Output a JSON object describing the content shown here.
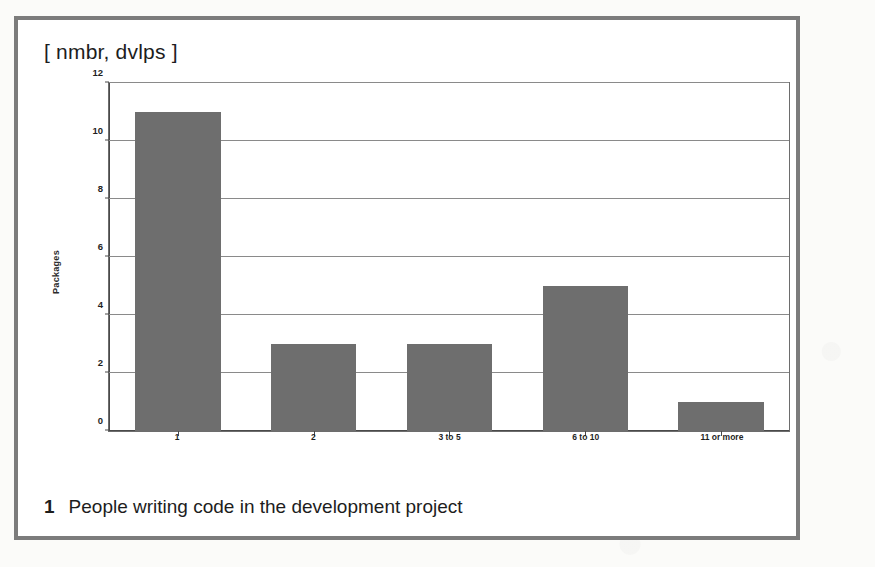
{
  "figure": {
    "header": "[ nmbr, dvlps ]",
    "caption_number": "1",
    "caption_text": "People writing code in the development project",
    "frame_color": "#7c7c7c",
    "page_background": "#fbfbf9"
  },
  "chart_data": {
    "type": "bar",
    "title": "",
    "xlabel": "",
    "ylabel": "Packages",
    "categories": [
      "1",
      "2",
      "3 to 5",
      "6 to 10",
      "11 or more"
    ],
    "values": [
      11,
      3,
      3,
      5,
      1
    ],
    "ylim": [
      0,
      12
    ],
    "yticks": [
      0,
      2,
      4,
      6,
      8,
      10,
      12
    ],
    "ytick_labels": [
      "0",
      "2",
      "4",
      "6",
      "8",
      "10",
      "12"
    ],
    "grid": true,
    "legend": false,
    "bar_color": "#6e6e6e",
    "gridline_color": "#8a8a8a",
    "axis_color": "#4a4a4a"
  }
}
